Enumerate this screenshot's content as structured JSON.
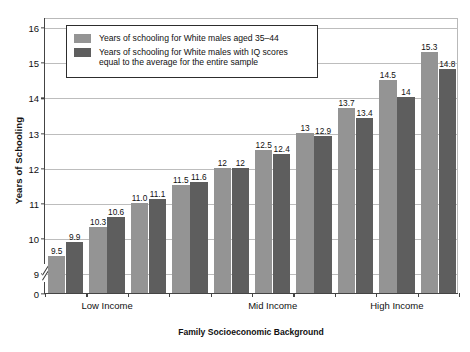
{
  "chart_data": {
    "type": "bar",
    "title": "",
    "xlabel": "Family Socioeconomic Background",
    "ylabel": "Years of Schooling",
    "ylim": [
      0,
      16
    ],
    "y_axis_break": true,
    "y_ticks": [
      "0",
      "9",
      "10",
      "11",
      "12",
      "13",
      "14",
      "15",
      "16"
    ],
    "grid": true,
    "legend_position": "upper-left-inside",
    "categories": [
      "1",
      "2",
      "3",
      "4",
      "5",
      "6",
      "7",
      "8",
      "9"
    ],
    "group_labels": [
      "Low Income",
      "Mid Income",
      "High Income"
    ],
    "series": [
      {
        "name": "Years of schooling for White males aged 35–44",
        "color": "#949494",
        "values": [
          9.5,
          10.3,
          11.0,
          11.5,
          12,
          12.5,
          13,
          13.7,
          14.5
        ],
        "labels": [
          "9.5",
          "10.3",
          "11.0",
          "11.5",
          "12",
          "12.5",
          "13",
          "13.7",
          "14.5"
        ]
      },
      {
        "name": "Years of schooling for White males with IQ scores equal to the average for the entire sample",
        "color": "#5e5e5e",
        "values": [
          9.9,
          10.6,
          11.1,
          11.6,
          12,
          12.4,
          12.9,
          13.4,
          14.0
        ],
        "labels": [
          "9.9",
          "10.6",
          "11.1",
          "11.6",
          "12",
          "12.4",
          "12.9",
          "13.4",
          "14"
        ]
      }
    ],
    "extra_pair": {
      "series_a": {
        "value": 15.3,
        "label": "15.3"
      },
      "series_b": {
        "value": 14.8,
        "label": "14.8"
      }
    }
  },
  "legend": {
    "entries": [
      {
        "label": "Years of schooling for White males aged 35–44",
        "color": "#949494"
      },
      {
        "label": "Years of schooling for White males with IQ scores equal to the average for the entire sample",
        "color": "#5e5e5e"
      }
    ]
  },
  "axes": {
    "y_title": "Years of Schooling",
    "x_title": "Family Socioeconomic Background",
    "y_tick_labels": [
      "16",
      "15",
      "14",
      "13",
      "12",
      "11",
      "10",
      "9",
      "0"
    ],
    "group_labels": [
      "Low Income",
      "Mid Income",
      "High Income"
    ]
  },
  "colors": {
    "series_a": "#949494",
    "series_b": "#5e5e5e",
    "axis": "#444444",
    "grid": "#bdbdbd",
    "text": "#111111"
  }
}
